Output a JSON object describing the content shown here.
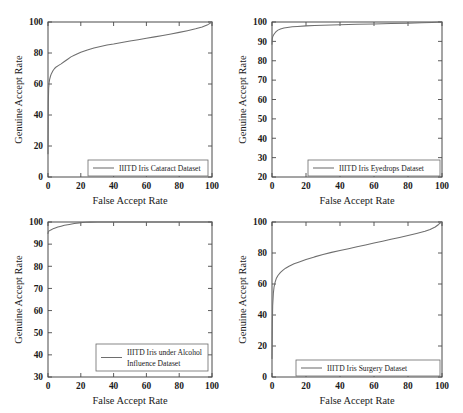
{
  "figure": {
    "background_color": "#ffffff",
    "axis_color": "#4a4a4a",
    "curve_color": "#6e6e6e",
    "panel_count": 4,
    "common_xlabel": "False Accept Rate",
    "common_ylabel": "Genuine Accept Rate"
  },
  "chart_data": [
    {
      "type": "line",
      "panel_index": 1,
      "panel_position": "top-left",
      "title": "",
      "xlabel": "False Accept Rate",
      "ylabel": "Genuine Accept Rate",
      "xlim": [
        0,
        100
      ],
      "ylim": [
        0,
        100
      ],
      "xticks": [
        0,
        20,
        40,
        60,
        80,
        100
      ],
      "yticks": [
        0,
        20,
        40,
        60,
        80,
        100
      ],
      "xticklabels": [
        "0",
        "20",
        "40",
        "60",
        "80",
        "100"
      ],
      "yticklabels": [
        "0",
        "20",
        "40",
        "60",
        "80",
        "100"
      ],
      "grid": false,
      "legend_position": "lower right",
      "series": [
        {
          "name": "IIITD Iris Cataract Dataset",
          "color": "#6e6e6e",
          "x": [
            0,
            0.2,
            0.4,
            0.7,
            1.0,
            1.5,
            2.0,
            3.0,
            4.0,
            5.0,
            6.5,
            8.0,
            10.0,
            12.0,
            14.0,
            16.0,
            18.0,
            20.0,
            24.0,
            28.0,
            32.0,
            36.0,
            40.0,
            45.0,
            50.0,
            55.0,
            60.0,
            65.0,
            70.0,
            75.0,
            80.0,
            85.0,
            90.0,
            94.0,
            97.0,
            99.0,
            100.0
          ],
          "y": [
            15,
            48,
            57,
            61,
            63,
            65,
            66.5,
            68.5,
            70,
            71,
            72,
            73,
            74.5,
            76,
            77.5,
            78.5,
            79.5,
            80.5,
            82,
            83.2,
            84.2,
            85.2,
            85.8,
            86.8,
            87.8,
            88.6,
            89.5,
            90.4,
            91.3,
            92.3,
            93.3,
            94.4,
            95.6,
            96.8,
            98.0,
            99.3,
            100
          ]
        }
      ]
    },
    {
      "type": "line",
      "panel_index": 2,
      "panel_position": "top-right",
      "title": "",
      "xlabel": "False Accept Rate",
      "ylabel": "Genuine Accept Rate",
      "xlim": [
        0,
        100
      ],
      "ylim": [
        20,
        100
      ],
      "xticks": [
        0,
        20,
        40,
        60,
        80,
        100
      ],
      "yticks": [
        20,
        30,
        40,
        50,
        60,
        70,
        80,
        90,
        100
      ],
      "xticklabels": [
        "0",
        "20",
        "40",
        "60",
        "80",
        "100"
      ],
      "yticklabels": [
        "20",
        "30",
        "40",
        "50",
        "60",
        "70",
        "80",
        "90",
        "100"
      ],
      "grid": false,
      "legend_position": "lower right",
      "series": [
        {
          "name": "IIITD Iris Eyedrops Dataset",
          "color": "#6e6e6e",
          "x": [
            0,
            0.15,
            0.3,
            0.6,
            1.0,
            1.6,
            2.4,
            3.5,
            5.0,
            7.0,
            9.0,
            12.0,
            15.0,
            20.0,
            25.0,
            30.0,
            40.0,
            50.0,
            60.0,
            70.0,
            80.0,
            88.0,
            94.0,
            97.0,
            99.0,
            100.0
          ],
          "y": [
            88.5,
            91.0,
            92.0,
            92.8,
            93.4,
            94.2,
            95.0,
            95.8,
            96.4,
            96.9,
            97.2,
            97.5,
            97.7,
            98.0,
            98.2,
            98.35,
            98.6,
            98.8,
            99.0,
            99.2,
            99.4,
            99.6,
            99.75,
            99.85,
            99.95,
            100
          ]
        }
      ]
    },
    {
      "type": "line",
      "panel_index": 3,
      "panel_position": "bottom-left",
      "title": "",
      "xlabel": "False Accept Rate",
      "ylabel": "Genuine  Accept Rate",
      "xlim": [
        0,
        100
      ],
      "ylim": [
        30,
        100
      ],
      "xticks": [
        0,
        20,
        40,
        60,
        80,
        100
      ],
      "yticks": [
        30,
        40,
        50,
        60,
        70,
        80,
        90,
        100
      ],
      "xticklabels": [
        "0",
        "20",
        "40",
        "60",
        "80",
        "100"
      ],
      "yticklabels": [
        "30",
        "40",
        "50",
        "60",
        "70",
        "80",
        "90",
        "100"
      ],
      "grid": false,
      "legend_position": "lower right",
      "series": [
        {
          "name": "IIITD Iris under Alcohol Influence Dataset",
          "name_line1": "IIITD Iris under Alcohol",
          "name_line2": "Influence Dataset",
          "color": "#6e6e6e",
          "x": [
            0,
            0.2,
            0.5,
            1.0,
            2.0,
            3.0,
            4.0,
            6.0,
            8.0,
            10.0,
            13.0,
            16.0,
            19.0,
            21.0,
            23.0,
            26.0,
            30.0,
            40.0,
            55.0,
            70.0,
            85.0,
            95.0,
            100.0
          ],
          "y": [
            94.8,
            95.6,
            95.9,
            96.1,
            96.5,
            96.9,
            97.2,
            97.7,
            98.1,
            98.5,
            98.9,
            99.3,
            99.6,
            99.8,
            99.9,
            99.95,
            100,
            100,
            100,
            100,
            100,
            100,
            100
          ]
        }
      ]
    },
    {
      "type": "line",
      "panel_index": 4,
      "panel_position": "bottom-right",
      "title": "",
      "xlabel": "False Accept Rate",
      "ylabel": "Genuine Accept Rate",
      "xlim": [
        0,
        100
      ],
      "ylim": [
        0,
        100
      ],
      "xticks": [
        0,
        20,
        40,
        60,
        80,
        100
      ],
      "yticks": [
        0,
        20,
        40,
        60,
        80,
        100
      ],
      "xticklabels": [
        "0",
        "20",
        "40",
        "60",
        "80",
        "100"
      ],
      "yticklabels": [
        "0",
        "20",
        "40",
        "60",
        "80",
        "100"
      ],
      "grid": false,
      "legend_position": "lower right",
      "series": [
        {
          "name": "IIITD Iris Surgery  Dataset",
          "color": "#6e6e6e",
          "x": [
            0,
            0.2,
            0.4,
            0.8,
            1.2,
            1.8,
            2.5,
            3.5,
            5.0,
            6.5,
            8.0,
            10.0,
            13.0,
            16.0,
            20.0,
            25.0,
            30.0,
            35.0,
            40.0,
            45.0,
            50.0,
            55.0,
            60.0,
            65.0,
            70.0,
            75.0,
            80.0,
            85.0,
            90.0,
            93.0,
            96.0,
            98.0,
            99.0,
            100.0
          ],
          "y": [
            12,
            34,
            46,
            54,
            58,
            61,
            63.5,
            65.5,
            67.5,
            69,
            70.2,
            71.5,
            73,
            74.2,
            75.8,
            77.5,
            79,
            80.4,
            81.6,
            82.8,
            84,
            85.2,
            86.4,
            87.6,
            88.8,
            90.0,
            91.3,
            92.6,
            94.0,
            95.2,
            96.8,
            98.4,
            99.4,
            100
          ]
        }
      ]
    }
  ]
}
